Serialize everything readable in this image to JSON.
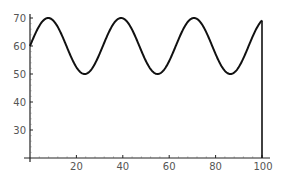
{
  "chart_data": {
    "type": "line",
    "title": "",
    "xlabel": "",
    "ylabel": "",
    "xlim": [
      0,
      100
    ],
    "ylim": [
      20,
      72
    ],
    "grid": false,
    "legend": null,
    "x_ticks": [
      20,
      40,
      60,
      80,
      100
    ],
    "y_ticks": [
      30,
      40,
      50,
      60,
      70
    ],
    "x_tick_labels": [
      "20",
      "40",
      "60",
      "80",
      "100"
    ],
    "y_tick_labels": [
      "30",
      "40",
      "50",
      "60",
      "70"
    ],
    "series": [
      {
        "name": "60 + 10 sin(x/5)",
        "color": "#111111",
        "x": [
          0,
          5,
          7.85,
          10,
          15,
          20,
          23.56,
          25,
          30,
          35,
          39.27,
          40,
          45,
          50,
          54.98,
          55,
          60,
          65,
          70.69,
          75,
          80,
          85,
          86.39,
          90,
          95,
          100
        ],
        "values": [
          60,
          68.4,
          70,
          69.1,
          61.4,
          52.4,
          50,
          50.4,
          57.2,
          66.6,
          70,
          69.9,
          64.1,
          54.6,
          50,
          50,
          54.6,
          64.2,
          70,
          67.5,
          58.2,
          50.1,
          50,
          51.8,
          61.5,
          69.1
        ],
        "end_drop_to_axis": true
      }
    ],
    "annotations": []
  },
  "plot": {
    "x_tick_labels": [
      "20",
      "40",
      "60",
      "80",
      "100"
    ],
    "y_tick_labels": [
      "70",
      "60",
      "50",
      "40",
      "30"
    ]
  }
}
